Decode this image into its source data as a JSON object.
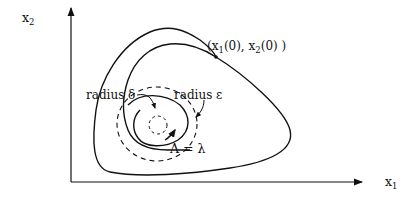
{
  "figure": {
    "axes": {
      "y_label": "x",
      "y_label_sub": "2",
      "x_label": "x",
      "x_label_sub": "1"
    },
    "initial_point": {
      "open": "(x",
      "sub1": "1",
      "mid": "(0),  x",
      "sub2": "2",
      "close": "(0) )"
    },
    "annotations": {
      "radius_delta": "radius  δ",
      "radius_epsilon": "radius  ε",
      "lambda_eq": "Λ = λ"
    },
    "colors": {
      "ink": "#111111",
      "background": "#ffffff"
    }
  }
}
